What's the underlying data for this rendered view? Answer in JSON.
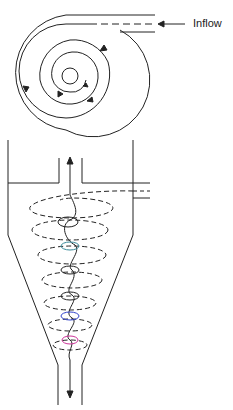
{
  "diagram": {
    "type": "cyclone-separator",
    "top_view": {
      "label": "Inflow",
      "description": "Plan view showing spiral flow path from tangential inlet"
    },
    "side_view": {
      "description": "Elevation view showing outer downward vortex and inner upward vortex",
      "parts": [
        "vortex-finder-outlet",
        "tangential-inlet",
        "cylindrical-body",
        "conical-section",
        "dust-outlet"
      ]
    },
    "colors": {
      "line": "#222222",
      "accent_blue": "#3344cc",
      "accent_magenta": "#cc3399",
      "accent_green": "#33aa55"
    }
  }
}
